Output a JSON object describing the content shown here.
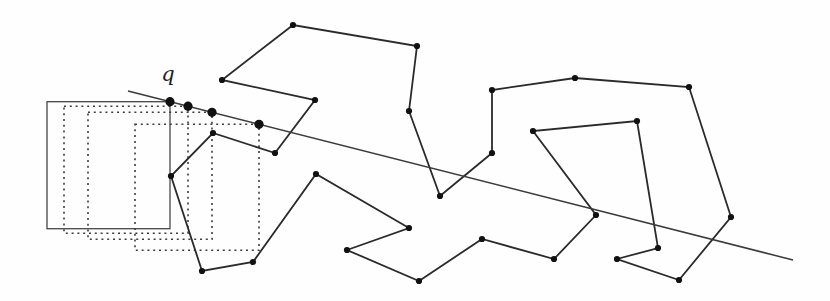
{
  "figure": {
    "width": 830,
    "height": 301,
    "background": "#fefefe",
    "ink": "#2a2a2a",
    "label": {
      "text": "q",
      "x": 168,
      "y": 81
    },
    "ray": {
      "x1": 128,
      "y1": 91,
      "x2": 793,
      "y2": 260,
      "color": "#3a3a3a",
      "width": 1.5
    },
    "polygon": {
      "color": "#2a2a2a",
      "width": 1.8,
      "vertex_radius": 3.1,
      "vertex_color": "#111111",
      "vertices": [
        [
          533,
          131
        ],
        [
          596,
          215
        ],
        [
          554,
          259
        ],
        [
          482,
          239
        ],
        [
          419,
          281
        ],
        [
          347,
          250
        ],
        [
          409,
          228
        ],
        [
          316,
          174
        ],
        [
          253,
          262
        ],
        [
          202,
          271
        ],
        [
          171,
          176
        ],
        [
          213,
          133
        ],
        [
          275,
          153
        ],
        [
          315,
          100
        ],
        [
          222,
          80
        ],
        [
          293,
          25
        ],
        [
          417,
          46
        ],
        [
          409,
          111
        ],
        [
          440,
          196
        ],
        [
          492,
          153
        ],
        [
          492,
          90
        ],
        [
          575,
          78
        ],
        [
          689,
          87
        ],
        [
          731,
          217
        ],
        [
          679,
          280
        ],
        [
          617,
          259
        ],
        [
          658,
          248
        ],
        [
          637,
          121
        ]
      ]
    },
    "windows": {
      "solid_color": "#474747",
      "dashed_color": "#3d3d3d",
      "solid_width": 1.3,
      "dashed_width": 1.6,
      "dash_pattern": "2 3.8",
      "rects": [
        {
          "style": "solid",
          "x": 47,
          "y": 101.7,
          "w": 123,
          "h": 127
        },
        {
          "style": "dashed",
          "x": 64,
          "y": 106.2,
          "w": 124,
          "h": 127
        },
        {
          "style": "dashed",
          "x": 88,
          "y": 112.3,
          "w": 124,
          "h": 127
        },
        {
          "style": "dashed",
          "x": 135,
          "y": 124.3,
          "w": 124,
          "h": 126
        }
      ]
    },
    "ray_points": {
      "radius": 4.6,
      "color": "#111111",
      "points": [
        [
          170,
          101.7
        ],
        [
          188,
          106.2
        ],
        [
          212,
          112.3
        ],
        [
          259,
          124.3
        ]
      ]
    }
  }
}
